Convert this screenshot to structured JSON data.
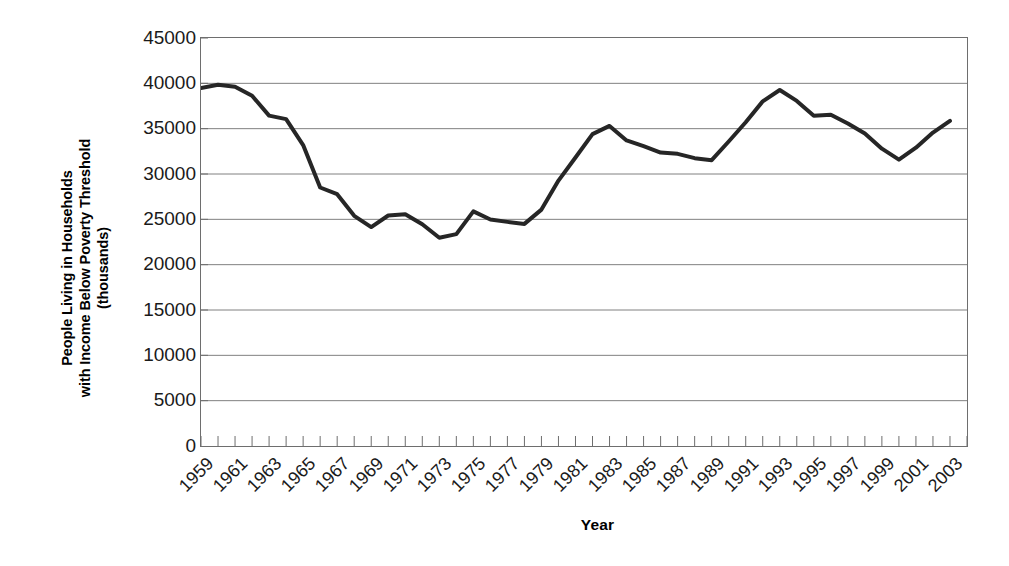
{
  "chart_data": {
    "type": "line",
    "title": "",
    "xlabel": "Year",
    "ylabel": "People Living in Households with Income Below Poverty Threshold (thousands)",
    "ylabel_lines": [
      "People Living in Households",
      "with Income Below Poverty Threshold",
      "(thousands)"
    ],
    "ylim": [
      0,
      45000
    ],
    "ytick_step": 5000,
    "yticks": [
      45000,
      40000,
      35000,
      30000,
      25000,
      20000,
      15000,
      10000,
      5000,
      0
    ],
    "ytick_labels": [
      "45000",
      "40000",
      "35000",
      "30000",
      "25000",
      "20000",
      "15000",
      "10000",
      "5000",
      "0"
    ],
    "xlim": [
      1959,
      2004
    ],
    "xtick_labels": [
      "1959",
      "1961",
      "1963",
      "1965",
      "1967",
      "1969",
      "1971",
      "1973",
      "1975",
      "1977",
      "1979",
      "1981",
      "1983",
      "1985",
      "1987",
      "1989",
      "1991",
      "1993",
      "1995",
      "1997",
      "1999",
      "2001",
      "2003"
    ],
    "xticks_all": [
      1959,
      1960,
      1961,
      1962,
      1963,
      1964,
      1965,
      1966,
      1967,
      1968,
      1969,
      1970,
      1971,
      1972,
      1973,
      1974,
      1975,
      1976,
      1977,
      1978,
      1979,
      1980,
      1981,
      1982,
      1983,
      1984,
      1985,
      1986,
      1987,
      1988,
      1989,
      1990,
      1991,
      1992,
      1993,
      1994,
      1995,
      1996,
      1997,
      1998,
      1999,
      2000,
      2001,
      2002,
      2003,
      2004
    ],
    "grid": "horizontal",
    "legend": "none",
    "line_color": "#262626",
    "line_width": 4,
    "x": [
      1959,
      1960,
      1961,
      1962,
      1963,
      1964,
      1965,
      1966,
      1967,
      1968,
      1969,
      1970,
      1971,
      1972,
      1973,
      1974,
      1975,
      1976,
      1977,
      1978,
      1979,
      1980,
      1981,
      1982,
      1983,
      1984,
      1985,
      1986,
      1987,
      1988,
      1989,
      1990,
      1991,
      1992,
      1993,
      1994,
      1995,
      1996,
      1997,
      1998,
      1999,
      2000,
      2001,
      2002,
      2003
    ],
    "values": [
      39490,
      39851,
      39628,
      38625,
      36436,
      36055,
      33185,
      28510,
      27769,
      25389,
      24147,
      25420,
      25559,
      24460,
      22973,
      23370,
      25877,
      24975,
      24720,
      24497,
      26072,
      29272,
      31822,
      34398,
      35303,
      33700,
      33064,
      32370,
      32221,
      31745,
      31528,
      33585,
      35708,
      38014,
      39265,
      38059,
      36425,
      36529,
      35574,
      34476,
      32791,
      31581,
      32907,
      34570,
      35861
    ]
  },
  "axis_styles": {
    "frame_color": "#6e6e6e",
    "grid_color": "#808080",
    "tick_color": "#6e6e6e",
    "text_color": "#1a1a1a"
  }
}
